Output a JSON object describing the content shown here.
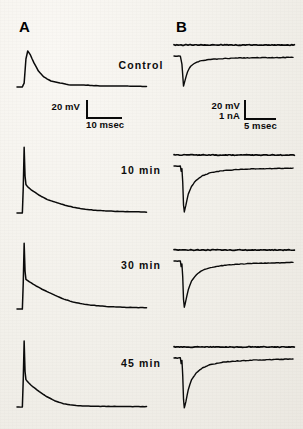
{
  "figure": {
    "panels": [
      {
        "letter": "A",
        "description": "intracellular voltage responses"
      },
      {
        "letter": "B",
        "description": "voltage clamp current records"
      }
    ],
    "row_labels": [
      "Control",
      "10 min",
      "30 min",
      "45 min"
    ],
    "scalebars": [
      {
        "panel": "A",
        "vertical_label": "20 mV",
        "vertical_label_2": "",
        "horizontal_label": "10 msec"
      },
      {
        "panel": "B",
        "vertical_label": "20 mV",
        "vertical_label_2": "1 nA",
        "horizontal_label": "5 msec"
      }
    ],
    "colors": {
      "trace": "#0a0a0a",
      "background": "#f3f1ec",
      "text": "#111111"
    }
  },
  "chart_data": {
    "type": "line",
    "title": "",
    "xlabel": "time",
    "ylabel": "membrane potential / membrane current",
    "grid": false,
    "legend": "none",
    "panels": [
      {
        "panel": "A",
        "signal": "membrane potential",
        "y_unit": "mV",
        "x_unit": "msec",
        "scale_vertical": 20,
        "scale_horizontal": 10,
        "series": [
          {
            "name": "Control",
            "peak_amplitude_mV": 18,
            "decay_shape": "rounded EPSP, slow decay to baseline",
            "points": [
              [
                0,
                0
              ],
              [
                6,
                0
              ],
              [
                8,
                2
              ],
              [
                10,
                14
              ],
              [
                12,
                18
              ],
              [
                15,
                16
              ],
              [
                19,
                12
              ],
              [
                24,
                8
              ],
              [
                30,
                5
              ],
              [
                38,
                3
              ],
              [
                48,
                2
              ],
              [
                60,
                1
              ],
              [
                75,
                1
              ],
              [
                95,
                0.5
              ],
              [
                120,
                0.5
              ],
              [
                145,
                0.3
              ]
            ]
          },
          {
            "name": "10 min",
            "peak_amplitude_mV": 78,
            "decay_shape": "fast action-potential spike then slow exponential decay",
            "points": [
              [
                0,
                0
              ],
              [
                6,
                0
              ],
              [
                7,
                30
              ],
              [
                8,
                78
              ],
              [
                9,
                44
              ],
              [
                10,
                34
              ],
              [
                13,
                30
              ],
              [
                18,
                26
              ],
              [
                25,
                21
              ],
              [
                34,
                16
              ],
              [
                45,
                12
              ],
              [
                58,
                8
              ],
              [
                72,
                5
              ],
              [
                90,
                3
              ],
              [
                110,
                2
              ],
              [
                130,
                1.5
              ],
              [
                145,
                1
              ]
            ]
          },
          {
            "name": "30 min",
            "peak_amplitude_mV": 80,
            "decay_shape": "spike followed by slower decay than 10 min",
            "points": [
              [
                0,
                0
              ],
              [
                6,
                0
              ],
              [
                7,
                32
              ],
              [
                8,
                80
              ],
              [
                9,
                46
              ],
              [
                10,
                36
              ],
              [
                14,
                33
              ],
              [
                20,
                29
              ],
              [
                28,
                24
              ],
              [
                38,
                19
              ],
              [
                50,
                13
              ],
              [
                64,
                8
              ],
              [
                80,
                5
              ],
              [
                100,
                3
              ],
              [
                120,
                2
              ],
              [
                145,
                1.5
              ]
            ]
          },
          {
            "name": "45 min",
            "peak_amplitude_mV": 82,
            "decay_shape": "spike with faster decay reaching flat baseline",
            "points": [
              [
                0,
                0
              ],
              [
                6,
                0
              ],
              [
                7,
                34
              ],
              [
                8,
                82
              ],
              [
                9,
                44
              ],
              [
                10,
                34
              ],
              [
                13,
                30
              ],
              [
                18,
                25
              ],
              [
                25,
                19
              ],
              [
                33,
                13
              ],
              [
                42,
                8
              ],
              [
                52,
                4
              ],
              [
                64,
                2
              ],
              [
                78,
                1
              ],
              [
                100,
                0.8
              ],
              [
                125,
                0.6
              ],
              [
                145,
                0.5
              ]
            ]
          }
        ]
      },
      {
        "panel": "B",
        "signal": "voltage step (upper) and membrane current (lower)",
        "y_unit": "nA",
        "x_unit": "msec",
        "scale_vertical_voltage": 20,
        "scale_vertical_current": 1,
        "scale_horizontal": 5,
        "series": [
          {
            "name": "Control",
            "voltage_trace": "flat",
            "peak_inward_current_nA": -0.9,
            "points": [
              [
                0,
                0
              ],
              [
                8,
                0
              ],
              [
                10,
                -0.25
              ],
              [
                12,
                -0.9
              ],
              [
                14,
                -0.72
              ],
              [
                17,
                -0.48
              ],
              [
                21,
                -0.3
              ],
              [
                27,
                -0.2
              ],
              [
                35,
                -0.14
              ],
              [
                46,
                -0.1
              ],
              [
                60,
                -0.08
              ],
              [
                80,
                -0.06
              ],
              [
                105,
                -0.05
              ],
              [
                130,
                -0.05
              ],
              [
                150,
                -0.04
              ]
            ]
          },
          {
            "name": "10 min",
            "voltage_trace": "flat",
            "peak_inward_current_nA": -2.6,
            "points": [
              [
                0,
                0
              ],
              [
                8,
                0
              ],
              [
                9,
                -0.3
              ],
              [
                10,
                -0.15
              ],
              [
                11,
                -0.9
              ],
              [
                12,
                -2.2
              ],
              [
                13,
                -2.6
              ],
              [
                15,
                -2.2
              ],
              [
                18,
                -1.6
              ],
              [
                22,
                -1.15
              ],
              [
                28,
                -0.8
              ],
              [
                36,
                -0.55
              ],
              [
                46,
                -0.38
              ],
              [
                60,
                -0.27
              ],
              [
                78,
                -0.2
              ],
              [
                100,
                -0.16
              ],
              [
                125,
                -0.14
              ],
              [
                150,
                -0.12
              ]
            ]
          },
          {
            "name": "30 min",
            "voltage_trace": "flat",
            "peak_inward_current_nA": -2.5,
            "points": [
              [
                0,
                0
              ],
              [
                8,
                0
              ],
              [
                9,
                -0.3
              ],
              [
                10,
                -0.15
              ],
              [
                11,
                -0.85
              ],
              [
                12,
                -2.1
              ],
              [
                13,
                -2.5
              ],
              [
                15,
                -2.15
              ],
              [
                18,
                -1.55
              ],
              [
                22,
                -1.1
              ],
              [
                28,
                -0.75
              ],
              [
                36,
                -0.5
              ],
              [
                46,
                -0.35
              ],
              [
                60,
                -0.25
              ],
              [
                78,
                -0.18
              ],
              [
                100,
                -0.13
              ],
              [
                125,
                -0.1
              ],
              [
                150,
                -0.08
              ]
            ]
          },
          {
            "name": "45 min",
            "voltage_trace": "flat",
            "peak_inward_current_nA": -2.3,
            "points": [
              [
                0,
                0
              ],
              [
                8,
                0
              ],
              [
                9,
                -0.25
              ],
              [
                10,
                -0.1
              ],
              [
                11,
                -0.8
              ],
              [
                12,
                -1.9
              ],
              [
                13,
                -2.3
              ],
              [
                15,
                -2.0
              ],
              [
                18,
                -1.45
              ],
              [
                22,
                -1.0
              ],
              [
                28,
                -0.68
              ],
              [
                36,
                -0.45
              ],
              [
                46,
                -0.3
              ],
              [
                60,
                -0.2
              ],
              [
                78,
                -0.14
              ],
              [
                100,
                -0.1
              ],
              [
                125,
                -0.07
              ],
              [
                150,
                -0.05
              ]
            ]
          }
        ]
      }
    ]
  }
}
